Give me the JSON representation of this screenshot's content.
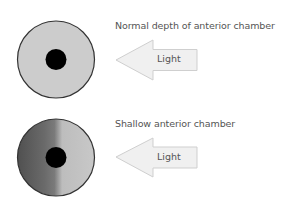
{
  "panels": [
    {
      "caption": "Normal depth of anterior chamber",
      "arrow_label": "Light",
      "eye_shading": "uniform",
      "iris_color": "#cccccc"
    },
    {
      "caption": "Shallow anterior chamber",
      "arrow_label": "Light",
      "eye_shading": "shadow-on-left",
      "iris_color_dark": "#555555",
      "iris_color_light": "#c4c4c4"
    }
  ],
  "colors": {
    "outline": "#333333",
    "pupil": "#000000",
    "arrow_fill": "#f0f0f0",
    "arrow_stroke": "#cfcfcf",
    "text": "#555555"
  }
}
